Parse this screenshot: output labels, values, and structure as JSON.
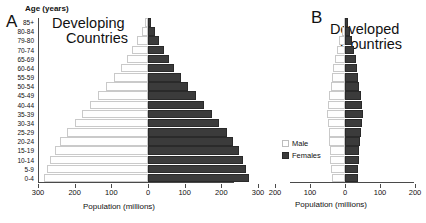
{
  "figure": {
    "panels": [
      {
        "letter": "A",
        "heading_line1": "Developing",
        "heading_line2": "Countries"
      },
      {
        "letter": "B",
        "heading_line1": "Developed",
        "heading_line2": "Countries"
      }
    ],
    "y_axis_title": "Age (years)",
    "x_axis_title": "Population (millions)",
    "legend": [
      {
        "key": "male",
        "label": "Male",
        "color": "#ffffff"
      },
      {
        "key": "female",
        "label": "Females",
        "color": "#3b3b3b"
      }
    ]
  },
  "chart_data": [
    {
      "type": "bar",
      "title": "Developing Countries",
      "panel": "A",
      "orientation": "horizontal-pyramid",
      "xlabel": "Population (millions)",
      "ylabel": "Age (years)",
      "xlim": [
        -300,
        300
      ],
      "xticks": [
        300,
        200,
        100,
        0,
        100,
        200,
        300
      ],
      "grid": false,
      "legend_position": "center-right",
      "categories": [
        "0-4",
        "5-9",
        "10-14",
        "15-19",
        "20-24",
        "25-29",
        "30-34",
        "35-39",
        "40-44",
        "45-49",
        "50-54",
        "55-59",
        "60-64",
        "65-69",
        "70-74",
        "79-80",
        "80-84",
        "85+"
      ],
      "series": [
        {
          "name": "Male",
          "side": "left",
          "values": [
            285,
            275,
            268,
            255,
            240,
            222,
            200,
            180,
            158,
            136,
            114,
            92,
            74,
            58,
            43,
            29,
            16,
            7
          ]
        },
        {
          "name": "Females",
          "side": "right",
          "values": [
            276,
            266,
            259,
            247,
            232,
            215,
            193,
            174,
            153,
            132,
            110,
            89,
            72,
            57,
            43,
            30,
            18,
            9
          ]
        }
      ]
    },
    {
      "type": "bar",
      "title": "Developed Countries",
      "panel": "B",
      "orientation": "horizontal-pyramid",
      "xlabel": "Population (millions)",
      "ylabel": "Age (years)",
      "xlim": [
        -200,
        200
      ],
      "xticks": [
        200,
        100,
        0,
        100,
        200
      ],
      "grid": false,
      "categories": [
        "0-4",
        "5-9",
        "10-14",
        "15-19",
        "20-24",
        "25-29",
        "30-34",
        "35-39",
        "40-44",
        "45-49",
        "50-54",
        "55-59",
        "60-64",
        "65-69",
        "70-74",
        "79-80",
        "80-84",
        "85+"
      ],
      "series": [
        {
          "name": "Male",
          "side": "left",
          "values": [
            38,
            40,
            42,
            43,
            45,
            47,
            50,
            52,
            50,
            46,
            41,
            37,
            33,
            29,
            23,
            16,
            9,
            4
          ]
        },
        {
          "name": "Females",
          "side": "right",
          "values": [
            36,
            38,
            40,
            41,
            43,
            45,
            48,
            50,
            49,
            45,
            41,
            38,
            35,
            32,
            27,
            21,
            14,
            8
          ]
        }
      ]
    }
  ]
}
